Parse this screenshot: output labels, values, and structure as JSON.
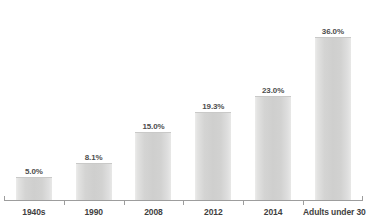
{
  "chart_data": {
    "type": "bar",
    "title": "",
    "xlabel": "",
    "ylabel": "",
    "grid": false,
    "legend": false,
    "ylim": [
      0,
      40
    ],
    "value_suffix": "%",
    "categories": [
      "1940s",
      "1990",
      "2008",
      "2012",
      "2014",
      "Adults under 30"
    ],
    "values": [
      5.0,
      8.1,
      15.0,
      19.3,
      23.0,
      36.0
    ],
    "data_labels": [
      "5.0%",
      "8.1%",
      "15.0%",
      "19.3%",
      "23.0%",
      "36.0%"
    ],
    "series": [
      {
        "name": "",
        "values": [
          5.0,
          8.1,
          15.0,
          19.3,
          23.0,
          36.0
        ]
      }
    ]
  },
  "style": {
    "bar_fill": "#d0d0cf",
    "bar_edge_light": "#ececeb",
    "bar_top_border": "#c9c9c8",
    "axis_color": "#9d9d9d",
    "label_color": "#3f3f3f",
    "value_color": "#4d4d4d",
    "background": "#ffffff"
  }
}
